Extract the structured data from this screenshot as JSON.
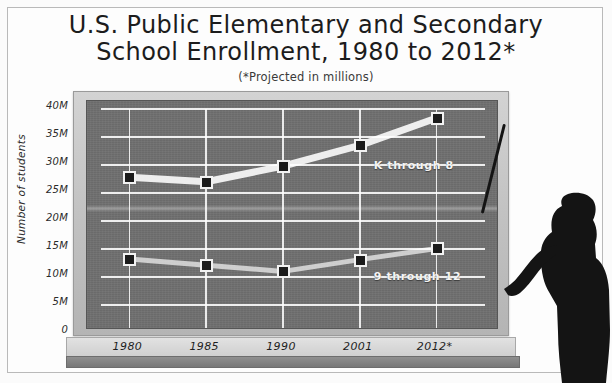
{
  "title": {
    "line1": "U.S. Public Elementary and Secondary",
    "line2": "School Enrollment, 1980 to 2012*",
    "subtitle": "(*Projected in millions)"
  },
  "chart_data": {
    "type": "line",
    "title": "U.S. Public Elementary and Secondary School Enrollment, 1980 to 2012*",
    "subtitle": "(*Projected in millions)",
    "xlabel": "",
    "ylabel": "Number of students",
    "categories": [
      "1980",
      "1985",
      "1990",
      "2001",
      "2012*"
    ],
    "ytick_labels": [
      "40M",
      "35M",
      "30M",
      "25M",
      "20M",
      "15M",
      "10M",
      "5M",
      "0"
    ],
    "ytick_values": [
      40,
      35,
      30,
      25,
      20,
      15,
      10,
      5,
      0
    ],
    "ylim": [
      0,
      40
    ],
    "grid": true,
    "legend": "inline-labels",
    "series": [
      {
        "name": "K through 8",
        "values": [
          27.8,
          27.0,
          29.8,
          33.5,
          38.4
        ]
      },
      {
        "name": "9 through 12",
        "values": [
          13.2,
          12.1,
          11.0,
          13.1,
          15.1
        ]
      }
    ]
  },
  "colors": {
    "board": "#6f6f6f",
    "frame": "#c6c6c6",
    "chalk": "#f2f2f2",
    "marker": "#1b1b1b",
    "silhouette": "#141414"
  },
  "decor": {
    "teacher_label": "teacher-silhouette",
    "pointer_label": "pointer-stick"
  }
}
